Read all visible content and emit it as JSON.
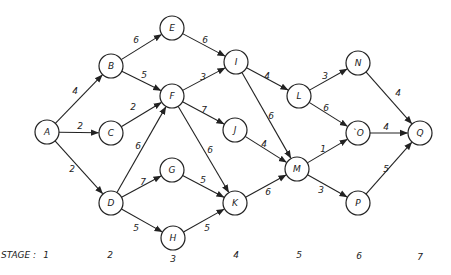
{
  "diagram": {
    "type": "directed-weighted-stage-graph",
    "node_radius": 12,
    "nodes": [
      {
        "id": "A",
        "label": "A",
        "x": 47,
        "y": 132,
        "stage": 1
      },
      {
        "id": "B",
        "label": "B",
        "x": 111,
        "y": 66,
        "stage": 2
      },
      {
        "id": "C",
        "label": "C",
        "x": 111,
        "y": 133,
        "stage": 2
      },
      {
        "id": "D",
        "label": "D",
        "x": 111,
        "y": 203,
        "stage": 2
      },
      {
        "id": "E",
        "label": "E",
        "x": 172,
        "y": 28,
        "stage": 3
      },
      {
        "id": "F",
        "label": "F",
        "x": 172,
        "y": 96,
        "stage": 3
      },
      {
        "id": "G",
        "label": "G",
        "x": 172,
        "y": 170,
        "stage": 3
      },
      {
        "id": "H",
        "label": "H",
        "x": 173,
        "y": 238,
        "stage": 3
      },
      {
        "id": "I",
        "label": "I",
        "x": 236,
        "y": 62,
        "stage": 4
      },
      {
        "id": "J",
        "label": "J",
        "x": 235,
        "y": 130,
        "stage": 4
      },
      {
        "id": "K",
        "label": "K",
        "x": 235,
        "y": 203,
        "stage": 4
      },
      {
        "id": "L",
        "label": "L",
        "x": 299,
        "y": 96,
        "stage": 5
      },
      {
        "id": "M",
        "label": "M",
        "x": 297,
        "y": 169,
        "stage": 5
      },
      {
        "id": "N",
        "label": "N",
        "x": 358,
        "y": 63,
        "stage": 6
      },
      {
        "id": "O",
        "label": "`O",
        "x": 358,
        "y": 133,
        "stage": 6
      },
      {
        "id": "P",
        "label": "P",
        "x": 358,
        "y": 203,
        "stage": 6
      },
      {
        "id": "Q",
        "label": "Q",
        "x": 420,
        "y": 133,
        "stage": 7
      }
    ],
    "edges": [
      {
        "from": "A",
        "to": "B",
        "weight": "4",
        "lx": 75,
        "ly": 91
      },
      {
        "from": "A",
        "to": "C",
        "weight": "2",
        "lx": 80,
        "ly": 126
      },
      {
        "from": "A",
        "to": "D",
        "weight": "2",
        "lx": 72,
        "ly": 169
      },
      {
        "from": "B",
        "to": "E",
        "weight": "6",
        "lx": 136,
        "ly": 40
      },
      {
        "from": "B",
        "to": "F",
        "weight": "5",
        "lx": 144,
        "ly": 75
      },
      {
        "from": "C",
        "to": "F",
        "weight": "2",
        "lx": 133,
        "ly": 107
      },
      {
        "from": "D",
        "to": "F",
        "weight": "6",
        "lx": 138,
        "ly": 146
      },
      {
        "from": "D",
        "to": "G",
        "weight": "7",
        "lx": 143,
        "ly": 182
      },
      {
        "from": "D",
        "to": "H",
        "weight": "5",
        "lx": 136,
        "ly": 228
      },
      {
        "from": "E",
        "to": "I",
        "weight": "6",
        "lx": 205,
        "ly": 40
      },
      {
        "from": "F",
        "to": "I",
        "weight": "3",
        "lx": 203,
        "ly": 77
      },
      {
        "from": "F",
        "to": "J",
        "weight": "7",
        "lx": 204,
        "ly": 110
      },
      {
        "from": "F",
        "to": "K",
        "weight": "6",
        "lx": 210,
        "ly": 150
      },
      {
        "from": "G",
        "to": "K",
        "weight": "5",
        "lx": 203,
        "ly": 180
      },
      {
        "from": "H",
        "to": "K",
        "weight": "5",
        "lx": 207,
        "ly": 228
      },
      {
        "from": "I",
        "to": "L",
        "weight": "4",
        "lx": 267,
        "ly": 76
      },
      {
        "from": "I",
        "to": "M",
        "weight": "6",
        "lx": 271,
        "ly": 116
      },
      {
        "from": "J",
        "to": "M",
        "weight": "4",
        "lx": 264,
        "ly": 144
      },
      {
        "from": "K",
        "to": "M",
        "weight": "6",
        "lx": 268,
        "ly": 192
      },
      {
        "from": "L",
        "to": "N",
        "weight": "3",
        "lx": 325,
        "ly": 76
      },
      {
        "from": "L",
        "to": "O",
        "weight": "6",
        "lx": 326,
        "ly": 108
      },
      {
        "from": "M",
        "to": "O",
        "weight": "1",
        "lx": 323,
        "ly": 149
      },
      {
        "from": "M",
        "to": "P",
        "weight": "3",
        "lx": 321,
        "ly": 190
      },
      {
        "from": "N",
        "to": "Q",
        "weight": "4",
        "lx": 398,
        "ly": 93
      },
      {
        "from": "O",
        "to": "Q",
        "weight": "4",
        "lx": 386,
        "ly": 127
      },
      {
        "from": "P",
        "to": "Q",
        "weight": "5",
        "lx": 386,
        "ly": 169
      }
    ]
  },
  "stage_row": {
    "title": "STAGE :",
    "title_x": 1,
    "y": 255,
    "stages": [
      {
        "label": "1",
        "x": 46,
        "y": 255
      },
      {
        "label": "2",
        "x": 110,
        "y": 255
      },
      {
        "label": "3",
        "x": 173,
        "y": 259
      },
      {
        "label": "4",
        "x": 236,
        "y": 255
      },
      {
        "label": "5",
        "x": 299,
        "y": 255
      },
      {
        "label": "6",
        "x": 359,
        "y": 256
      },
      {
        "label": "7",
        "x": 420,
        "y": 257
      }
    ]
  },
  "colors": {
    "stroke": "#222222",
    "background": "#ffffff"
  }
}
